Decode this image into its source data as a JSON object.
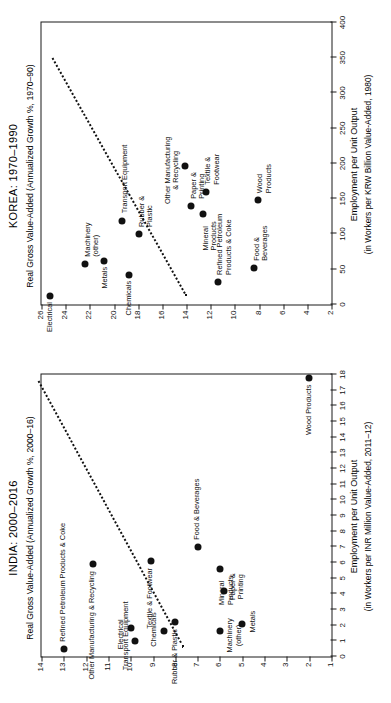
{
  "figure": {
    "panels": [
      {
        "id": "korea",
        "title": "KOREA: 1970–1990",
        "ylabel": "Real Gross Value-Added (Annualized Growth %, 1970–90)",
        "xlabel_line1": "Employment per Unit Output",
        "xlabel_line2": "(in Workers per KRW Billion Value-Added, 1980)"
      },
      {
        "id": "india",
        "title": "INDIA: 2000–2016",
        "ylabel": "Real Gross Value-Added (Annualized Growth %, 2000–16)",
        "xlabel_line1": "Employment per Unit Output",
        "xlabel_line2": "(in Workers per INR Million Value-Added, 2011–12)"
      }
    ]
  },
  "chart_data": [
    {
      "type": "scatter",
      "panel": "korea",
      "title": "KOREA: 1970–1990",
      "xlabel": "Employment per Unit Output (in Workers per KRW Billion Value-Added, 1980)",
      "ylabel": "Real Gross Value-Added (Annualized Growth %, 1970–90)",
      "xlim": [
        0,
        400
      ],
      "ylim": [
        2,
        26
      ],
      "xticks": [
        0,
        50,
        100,
        150,
        200,
        250,
        300,
        350,
        400
      ],
      "yticks": [
        2,
        4,
        6,
        8,
        10,
        12,
        14,
        16,
        18,
        20,
        22,
        24,
        26
      ],
      "grid": false,
      "legend": null,
      "trendline": {
        "style": "dotted",
        "x": [
          12,
          350
        ],
        "y": [
          14.1,
          25.2
        ]
      },
      "points": [
        {
          "label": "Electrical",
          "x": 12,
          "y": 25.3
        },
        {
          "label": "Machinery\n(other)",
          "x": 58,
          "y": 22.4
        },
        {
          "label": "Transport Equipment",
          "x": 118,
          "y": 19.3
        },
        {
          "label": "Chemicals",
          "x": 42,
          "y": 18.8
        },
        {
          "label": "Rubber &\nPlastic",
          "x": 100,
          "y": 17.9
        },
        {
          "label": "Metals",
          "x": 62,
          "y": 20.8
        },
        {
          "label": "Other Manufacturing\n& Recycling",
          "x": 196,
          "y": 14.1
        },
        {
          "label": "Paper &\nPrinting",
          "x": 140,
          "y": 13.6
        },
        {
          "label": "Mineral\nProducts",
          "x": 128,
          "y": 12.6
        },
        {
          "label": "Textile &\nFootwear",
          "x": 160,
          "y": 12.4
        },
        {
          "label": "Refined Petroleum\nProducts & Coke",
          "x": 32,
          "y": 11.4
        },
        {
          "label": "Food &\nBeverages",
          "x": 52,
          "y": 8.4
        },
        {
          "label": "Wood\nProducts",
          "x": 148,
          "y": 8.1
        }
      ]
    },
    {
      "type": "scatter",
      "panel": "india",
      "title": "INDIA: 2000–2016",
      "xlabel": "Employment per Unit Output (in Workers per INR Million Value-Added, 2011–12)",
      "ylabel": "Real Gross Value-Added (Annualized Growth %, 2000–16)",
      "xlim": [
        0,
        18
      ],
      "ylim": [
        1,
        14
      ],
      "xticks": [
        0,
        1,
        2,
        3,
        4,
        5,
        6,
        7,
        8,
        9,
        10,
        11,
        12,
        13,
        14,
        15,
        16,
        17,
        18
      ],
      "yticks": [
        1,
        2,
        3,
        4,
        5,
        6,
        7,
        8,
        9,
        10,
        11,
        12,
        13,
        14
      ],
      "grid": false,
      "legend": null,
      "trendline": {
        "style": "dotted",
        "x": [
          0.6,
          17.6
        ],
        "y": [
          7.7,
          14.2
        ]
      },
      "points": [
        {
          "label": "Refined Petroleum Products & Coke",
          "x": 0.5,
          "y": 13.0
        },
        {
          "label": "Other Manufacturing & Recycling",
          "x": 5.9,
          "y": 11.7
        },
        {
          "label": "Electrical",
          "x": 1.8,
          "y": 10.0
        },
        {
          "label": "Transport Equipment",
          "x": 1.0,
          "y": 9.8
        },
        {
          "label": "Textile & Footwear",
          "x": 6.1,
          "y": 9.1
        },
        {
          "label": "Chemicals",
          "x": 1.6,
          "y": 8.5
        },
        {
          "label": "Rubber & Plastic",
          "x": 2.2,
          "y": 8.0
        },
        {
          "label": "Food & Beverages",
          "x": 7.0,
          "y": 7.0
        },
        {
          "label": "Machinery\n(other)",
          "x": 1.6,
          "y": 6.0
        },
        {
          "label": "Mineral\nProducts",
          "x": 5.6,
          "y": 6.0
        },
        {
          "label": "Paper &\nPrinting",
          "x": 4.2,
          "y": 5.8
        },
        {
          "label": "Metals",
          "x": 2.1,
          "y": 5.0
        },
        {
          "label": "Wood Products",
          "x": 17.8,
          "y": 2.0
        }
      ]
    }
  ],
  "labels": {
    "korea_point_labels": [
      "Electrical",
      "Machinery (other)",
      "Transport Equipment",
      "Chemicals",
      "Rubber & Plastic",
      "Metals",
      "Other Manufacturing & Recycling",
      "Paper & Printing",
      "Mineral Products",
      "Textile & Footwear",
      "Refined Petroleum Products & Coke",
      "Food & Beverages",
      "Wood Products"
    ],
    "india_point_labels": [
      "Refined Petroleum Products & Coke",
      "Other Manufacturing & Recycling",
      "Electrical",
      "Transport Equipment",
      "Textile & Footwear",
      "Chemicals",
      "Rubber & Plastic",
      "Food & Beverages",
      "Machinery (other)",
      "Mineral Products",
      "Paper & Printing",
      "Metals",
      "Wood Products"
    ]
  }
}
